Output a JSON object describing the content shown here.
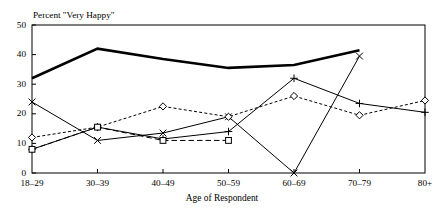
{
  "chart_data": {
    "type": "line",
    "title": "",
    "subtitle": "Percent \"Very Happy\"",
    "xlabel": "Age of Respondent",
    "ylabel": "",
    "categories": [
      "18–29",
      "30–39",
      "40–49",
      "50–59",
      "60–69",
      "70–79",
      "80+"
    ],
    "ylim": [
      0,
      50
    ],
    "yticks": [
      0,
      10,
      20,
      30,
      40,
      50
    ],
    "ytick_labels": [
      "0",
      "10",
      "20",
      "30",
      "40",
      "50"
    ],
    "grid": false,
    "legend": "none",
    "series": [
      {
        "name": "thick-solid-series",
        "marker": "none",
        "line_style": "solid",
        "line_width": 2.6,
        "values": [
          32,
          42,
          38.5,
          35.5,
          36.5,
          41.5,
          null
        ]
      },
      {
        "name": "x-marker-series",
        "marker": "x",
        "line_style": "solid",
        "line_width": 1,
        "values": [
          24,
          11,
          13.5,
          19,
          0,
          39.5,
          null
        ]
      },
      {
        "name": "diamond-marker-series",
        "marker": "diamond",
        "line_style": "dashed",
        "line_width": 1,
        "values": [
          12,
          15.5,
          22.5,
          19,
          26,
          19.5,
          24.5
        ]
      },
      {
        "name": "plus-marker-series",
        "marker": "plus",
        "line_style": "solid",
        "line_width": 1,
        "values": [
          8,
          15.5,
          11.5,
          14,
          32,
          23.5,
          20.5
        ]
      },
      {
        "name": "square-marker-series",
        "marker": "square",
        "line_style": "long-dashed",
        "line_width": 1,
        "values": [
          8,
          15.5,
          11,
          11,
          null,
          null,
          null
        ]
      }
    ]
  },
  "colors": {
    "ink": "#000000",
    "background": "#ffffff",
    "title_faded": "#b9b9b9"
  }
}
